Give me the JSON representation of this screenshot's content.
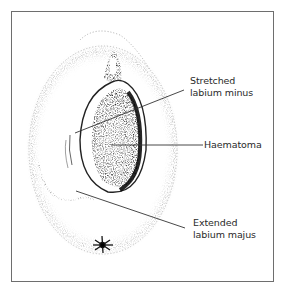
{
  "figure": {
    "labels": [
      {
        "id": "stretched-labium-minus",
        "line1": "Stretched",
        "line2": "labium minus"
      },
      {
        "id": "haematoma",
        "line1": "Haematoma"
      },
      {
        "id": "extended-labium-majus",
        "line1": "Extended",
        "line2": "labium majus"
      }
    ]
  },
  "colors": {
    "frame": "#6e6e6e",
    "ink": "#1a1a1a",
    "leader": "#333333"
  }
}
